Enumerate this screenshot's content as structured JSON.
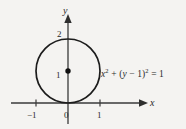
{
  "figure": {
    "background_color": "#f4f3f1",
    "ink_color": "#2a2a2a"
  },
  "equation": {
    "full": "x² + (y − 1)² = 1",
    "lhs_var1": "x",
    "lhs_exp1": "2",
    "plus": "+",
    "paren_open": "(",
    "lhs_var2": "y",
    "minus": "−",
    "offset": "1",
    "paren_close": ")",
    "lhs_exp2": "2",
    "equals": "=",
    "rhs": "1"
  },
  "axes": {
    "x_label": "x",
    "y_label": "y"
  },
  "ticks": {
    "x": [
      {
        "label": "−1",
        "value": -1
      },
      {
        "label": "0",
        "value": 0
      },
      {
        "label": "1",
        "value": 1
      }
    ],
    "y": [
      {
        "label": "1",
        "value": 1
      },
      {
        "label": "2",
        "value": 2
      }
    ]
  },
  "chart_data": {
    "type": "scatter",
    "title": "",
    "subtitle": "",
    "xlabel": "x",
    "ylabel": "y",
    "xlim": [
      -1.6,
      2.2
    ],
    "ylim": [
      -0.4,
      2.6
    ],
    "grid": false,
    "legend": "none",
    "annotations": [
      {
        "text": "x² + (y − 1)² = 1",
        "x": 1.1,
        "y": 1.0
      }
    ],
    "shapes": [
      {
        "kind": "circle",
        "center_x": 0,
        "center_y": 1,
        "radius": 1,
        "stroke": "#1c1c1c",
        "fill": "none",
        "stroke_width": 1.7
      }
    ],
    "points": [
      {
        "label": "center",
        "x": 0,
        "y": 1,
        "marker": "filled-dot"
      }
    ],
    "x_ticks": [
      -1,
      0,
      1
    ],
    "x_tick_labels": [
      "−1",
      "0",
      "1"
    ],
    "y_ticks": [
      1,
      2
    ],
    "y_tick_labels": [
      "1",
      "2"
    ]
  }
}
